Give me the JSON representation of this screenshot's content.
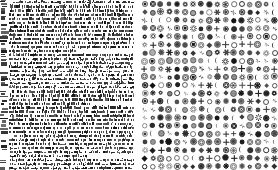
{
  "figure": {
    "type": "two-panel-texture-comparison",
    "background_color": "#ffffff",
    "ink_color": "#111111",
    "width_px": 278,
    "height_px": 170
  },
  "left_panel": {
    "name": "dense-microtext-block",
    "description": "Dense block of unreadable micro-text, black on white, full-bleed",
    "x": 0,
    "y": 0,
    "width": 134,
    "height": 170,
    "ink_color": "#111111",
    "background_color": "#ffffff",
    "row_count": 42,
    "row_pitch_px": 4.05,
    "margin_strip": {
      "name": "left-margin-tick-strip",
      "x": 0,
      "width": 9,
      "description": "Narrow vertical strip of irregular dark tick marks along the left edge"
    },
    "text_area": {
      "x": 9,
      "width": 125,
      "description": "Justified block of illegible character-sized marks"
    }
  },
  "right_panel": {
    "name": "symbol-glyph-grid",
    "description": "Regular grid of circular and radial dingbat symbol glyphs, black on white",
    "x": 140,
    "y": 0,
    "width": 138,
    "height": 170,
    "ink_color": "#111111",
    "background_color": "#ffffff",
    "columns": 17,
    "rows": 21,
    "cell_pitch_x_px": 8.1,
    "cell_pitch_y_px": 8.1,
    "glyph_diameter_px": 6.6,
    "glyph_families": [
      "ring",
      "double-ring",
      "dotted-ring",
      "spoked-wheel",
      "filled-disc",
      "starburst",
      "plus-cross",
      "diamond",
      "square-in-ring",
      "crescent",
      "gear",
      "asterisk",
      "pinwheel",
      "flower",
      "target",
      "hatched-disc"
    ]
  },
  "gutter": {
    "name": "panel-gutter",
    "x": 134,
    "width": 6,
    "color": "#ffffff"
  }
}
